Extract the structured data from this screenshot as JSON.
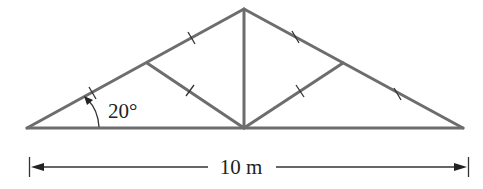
{
  "diagram": {
    "type": "roof-truss",
    "angle_label": "20°",
    "span_label": "10 m",
    "member_color": "#6d6d6d",
    "annotation_color": "#222222",
    "nodes": {
      "left_support": [
        27,
        128
      ],
      "apex": [
        244,
        9
      ],
      "right_support": [
        463,
        128
      ],
      "bottom_center": [
        244,
        128
      ],
      "left_mid_rafter": [
        147,
        63
      ],
      "right_mid_rafter": [
        343,
        63
      ]
    },
    "members": [
      {
        "name": "bottom-chord",
        "from": "left_support",
        "to": "right_support"
      },
      {
        "name": "left-rafter",
        "from": "left_support",
        "to": "apex"
      },
      {
        "name": "right-rafter",
        "from": "apex",
        "to": "right_support"
      },
      {
        "name": "king-post",
        "from": "apex",
        "to": "bottom_center"
      },
      {
        "name": "left-web",
        "from": "left_mid_rafter",
        "to": "bottom_center"
      },
      {
        "name": "right-web",
        "from": "right_mid_rafter",
        "to": "bottom_center"
      }
    ],
    "equal_length_tick_marks": 6
  }
}
